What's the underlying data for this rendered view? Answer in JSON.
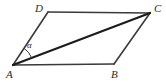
{
  "figure": {
    "kind": "parallelogram-with-diagonal",
    "background_color": "#ffffff",
    "stroke_color": "#3a3a3a",
    "stroke_color_diagonal": "#1c1c1c",
    "text_color": "#2b2b2b",
    "vertices": [
      {
        "name": "A",
        "label": "A",
        "x": 13,
        "y": 65,
        "label_x": 6,
        "label_y": 69
      },
      {
        "name": "B",
        "label": "B",
        "x": 114,
        "y": 64,
        "label_x": 111,
        "label_y": 69
      },
      {
        "name": "C",
        "label": "C",
        "x": 150,
        "y": 13,
        "label_x": 154,
        "label_y": 3
      },
      {
        "name": "D",
        "label": "D",
        "x": 48,
        "y": 12,
        "label_x": 35,
        "label_y": 3
      }
    ],
    "edges": [
      {
        "name": "side-AB",
        "from": "A",
        "to": "B",
        "width": 1.6
      },
      {
        "name": "side-BC",
        "from": "B",
        "to": "C",
        "width": 1.6
      },
      {
        "name": "side-CD",
        "from": "C",
        "to": "D",
        "width": 1.6
      },
      {
        "name": "side-DA",
        "from": "D",
        "to": "A",
        "width": 1.6
      },
      {
        "name": "diagonal-AC",
        "from": "A",
        "to": "C",
        "width": 2.2
      }
    ],
    "angle_marks": [
      {
        "name": "angle-alpha",
        "label": "α",
        "at_vertex": "A",
        "between": [
          "D",
          "C"
        ],
        "radius": 20,
        "label_x": 27,
        "label_y": 41
      }
    ]
  }
}
